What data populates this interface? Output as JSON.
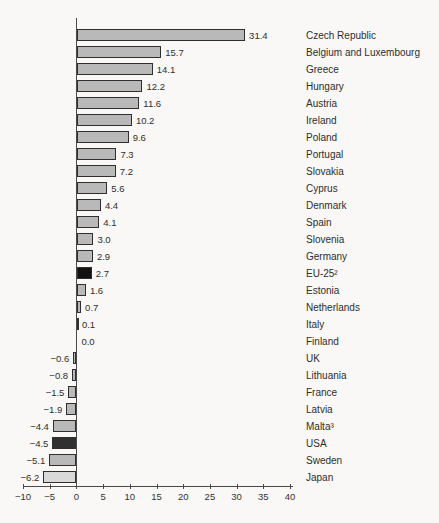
{
  "colors": {
    "background": "#f9f8f6",
    "axis": "#4a4a4a",
    "bar_border": "#2f2f2f",
    "bar_default": "#b9b9b9",
    "bar_black": "#121212",
    "bar_dark": "#303030",
    "bar_light": "#d9d9d9",
    "text": "#2e2e2e"
  },
  "chart_data": {
    "type": "bar",
    "orientation": "horizontal",
    "title": "",
    "xlabel": "",
    "ylabel": "",
    "xlim": [
      -10,
      40
    ],
    "x_ticks": [
      -10,
      -5,
      0,
      5,
      10,
      15,
      20,
      25,
      30,
      35,
      40
    ],
    "grid": false,
    "legend": false,
    "value_labels_shown": true,
    "categories": [
      "Czech Republic",
      "Belgium and Luxembourg",
      "Greece",
      "Hungary",
      "Austria",
      "Ireland",
      "Poland",
      "Portugal",
      "Slovakia",
      "Cyprus",
      "Denmark",
      "Spain",
      "Slovenia",
      "Germany",
      "EU-25²",
      "Estonia",
      "Netherlands",
      "Italy",
      "Finland",
      "UK",
      "Lithuania",
      "France",
      "Latvia",
      "Malta³",
      "USA",
      "Sweden",
      "Japan"
    ],
    "values": [
      31.4,
      15.7,
      14.1,
      12.2,
      11.6,
      10.2,
      9.6,
      7.3,
      7.2,
      5.6,
      4.4,
      4.1,
      3.0,
      2.9,
      2.7,
      1.6,
      0.7,
      0.1,
      0.0,
      -0.6,
      -0.8,
      -1.5,
      -1.9,
      -4.4,
      -4.5,
      -5.1,
      -6.2
    ],
    "bar_colors": [
      "#b9b9b9",
      "#b9b9b9",
      "#b9b9b9",
      "#b9b9b9",
      "#b9b9b9",
      "#b9b9b9",
      "#b9b9b9",
      "#b9b9b9",
      "#b9b9b9",
      "#b9b9b9",
      "#b9b9b9",
      "#b9b9b9",
      "#b9b9b9",
      "#b9b9b9",
      "#121212",
      "#b9b9b9",
      "#b9b9b9",
      "#b9b9b9",
      "#b9b9b9",
      "#b9b9b9",
      "#b9b9b9",
      "#b9b9b9",
      "#b9b9b9",
      "#b9b9b9",
      "#303030",
      "#b9b9b9",
      "#d9d9d9"
    ]
  }
}
